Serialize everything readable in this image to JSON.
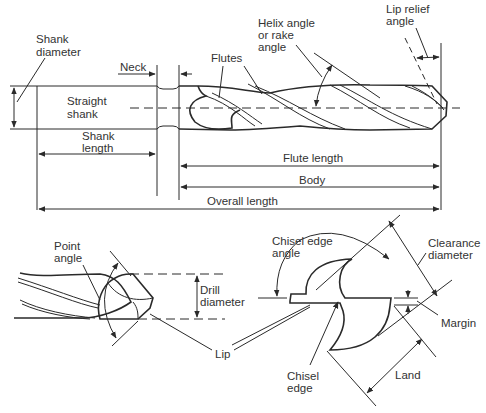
{
  "colors": {
    "line": "#2a2a2a",
    "text": "#333333",
    "background": "#ffffff"
  },
  "side_view": {
    "labels": {
      "shank_diameter_1": "Shank",
      "shank_diameter_2": "diameter",
      "neck": "Neck",
      "flutes": "Flutes",
      "helix_1": "Helix angle",
      "helix_2": "or rake",
      "helix_3": "angle",
      "lip_relief_1": "Lip relief",
      "lip_relief_2": "angle",
      "straight_shank_1": "Straight",
      "straight_shank_2": "shank",
      "shank_length_1": "Shank",
      "shank_length_2": "length",
      "flute_length": "Flute length",
      "body": "Body",
      "overall_length": "Overall length"
    }
  },
  "point_view": {
    "labels": {
      "point_angle_1": "Point",
      "point_angle_2": "angle",
      "drill_diameter_1": "Drill",
      "drill_diameter_2": "diameter",
      "lip": "Lip"
    }
  },
  "end_view": {
    "labels": {
      "chisel_edge_angle_1": "Chisel edge",
      "chisel_edge_angle_2": "angle",
      "clearance_diameter_1": "Clearance",
      "clearance_diameter_2": "diameter",
      "margin": "Margin",
      "chisel_edge_1": "Chisel",
      "chisel_edge_2": "edge",
      "land": "Land"
    }
  }
}
